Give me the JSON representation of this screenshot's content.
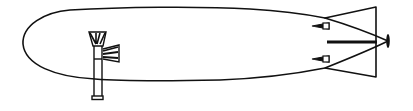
{
  "figure": {
    "colors": {
      "line": "#111111",
      "background": "#ffffff"
    }
  },
  "parts": {
    "hull": {
      "label": "Hull"
    },
    "gondola": {
      "label": "Gondola"
    },
    "tail_fins": {
      "label": "Tail fins"
    },
    "propeller": {
      "label": "Propeller"
    },
    "stabilizers": {
      "label": "Stabilizers"
    }
  }
}
